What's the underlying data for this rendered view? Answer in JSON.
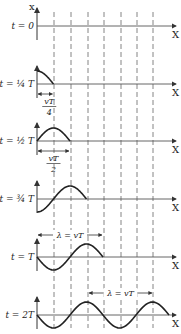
{
  "figure": {
    "y_axis_label": "x",
    "x_axis_label": "X",
    "rows": [
      {
        "label": "t = 0",
        "baseline": 26,
        "extent_quarters": 0
      },
      {
        "label": "t = ¼ T",
        "baseline": 84,
        "extent_quarters": 1,
        "annotation_num": "vT",
        "annotation_den": "4"
      },
      {
        "label": "t = ½ T",
        "baseline": 141,
        "extent_quarters": 2,
        "annotation_num": "vT",
        "annotation_den": "2"
      },
      {
        "label": "t = ¾ T",
        "baseline": 199,
        "extent_quarters": 3
      },
      {
        "label": "t = T",
        "baseline": 257,
        "extent_quarters": 4,
        "annotation": "λ = vT"
      },
      {
        "label": "t = 2T",
        "baseline": 315,
        "extent_quarters": 8,
        "annotation": "λ = vT"
      }
    ],
    "dashed_line_x": [
      54,
      71,
      88,
      104,
      121,
      137,
      153
    ],
    "origin_x": 37,
    "quarter_wavelength_px": 16.5,
    "amplitude_px": 13,
    "colors": {
      "stroke": "#222222",
      "axis": "#555555",
      "dash": "#666666"
    }
  }
}
